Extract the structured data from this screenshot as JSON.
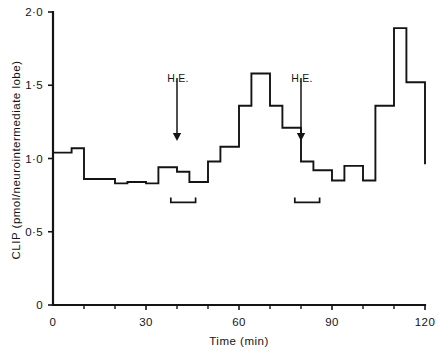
{
  "chart_data": {
    "type": "line",
    "subtype": "step",
    "title": "",
    "xlabel": "Time (min)",
    "ylabel": "CLIP (pmol/neurointermediate lobe)",
    "xlim": [
      0,
      120
    ],
    "ylim": [
      0,
      2.0
    ],
    "grid": false,
    "legend": null,
    "x_ticks": [
      0,
      30,
      60,
      90,
      120
    ],
    "x_tick_labels": [
      "0",
      "30",
      "60",
      "90",
      "120"
    ],
    "x_minor_tick_interval": 10,
    "y_ticks": [
      0,
      0.5,
      1.0,
      1.5,
      2.0
    ],
    "y_tick_labels": [
      "0",
      "0·5",
      "1·0",
      "1·5",
      "2·0"
    ],
    "series": [
      {
        "name": "CLIP release",
        "style": "step-post",
        "x_edges": [
          0,
          6,
          10,
          20,
          24,
          30,
          34,
          40,
          44,
          50,
          54,
          60,
          64,
          70,
          74,
          80,
          84,
          90,
          94,
          100,
          104,
          110,
          114,
          120
        ],
        "values": [
          1.04,
          1.07,
          0.86,
          0.83,
          0.84,
          0.83,
          0.94,
          0.91,
          0.84,
          0.98,
          1.08,
          1.36,
          1.58,
          1.36,
          1.21,
          0.98,
          0.92,
          0.85,
          0.95,
          0.85,
          1.36,
          1.89,
          1.52,
          0.96,
          0.89,
          0.84,
          0.82
        ]
      }
    ],
    "annotations": [
      {
        "type": "arrow",
        "label": "H.E.",
        "x": 40,
        "label_y": 1.55,
        "tip_y": 1.12
      },
      {
        "type": "arrow",
        "label": "H.E.",
        "x": 80,
        "label_y": 1.55,
        "tip_y": 1.12
      },
      {
        "type": "bracket",
        "x_start": 38,
        "x_end": 46,
        "y": 0.7
      },
      {
        "type": "bracket",
        "x_start": 78,
        "x_end": 86,
        "y": 0.7
      }
    ]
  },
  "axes": {
    "y_axis_title": "CLIP (pmol/neurointermediate lobe)",
    "x_axis_title": "Time (min)",
    "y_tick_labels": [
      "2·0",
      "1·5",
      "1·0",
      "0·5",
      "0"
    ],
    "x_tick_labels": [
      "0",
      "30",
      "60",
      "90",
      "120"
    ]
  },
  "markers": {
    "he_label_1": "H.E.",
    "he_label_2": "H.E."
  },
  "colors": {
    "ink": "#141414",
    "background": "#ffffff"
  }
}
